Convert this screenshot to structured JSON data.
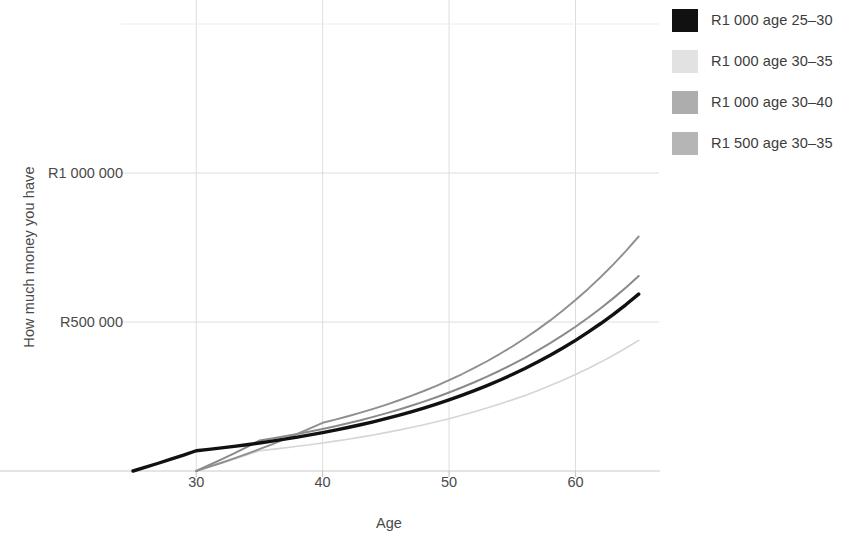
{
  "chart_data": {
    "type": "line",
    "title": "",
    "xlabel": "Age",
    "ylabel": "How much money you have",
    "xlim": [
      25,
      65.5
    ],
    "ylim": [
      0,
      1600000
    ],
    "xticks": [
      30,
      40,
      50,
      60
    ],
    "xtick_labels": [
      "30",
      "40",
      "50",
      "60"
    ],
    "yticks": [
      500000,
      1000000
    ],
    "ytick_labels": [
      "R500 000",
      "R1 000 000"
    ],
    "grid": true,
    "legend_position": "right",
    "series": [
      {
        "name": "R1 000 age 25–30",
        "color": "#111111",
        "width": 3.4,
        "x": [
          25,
          26,
          27,
          28,
          29,
          30,
          31,
          32,
          33,
          34,
          35,
          36,
          37,
          38,
          39,
          40,
          41,
          42,
          43,
          44,
          45,
          46,
          47,
          48,
          49,
          50,
          51,
          52,
          53,
          54,
          55,
          56,
          57,
          58,
          59,
          60,
          61,
          62,
          63,
          64,
          65
        ],
        "y": [
          0,
          12800,
          26000,
          39600,
          53600,
          68000,
          72700,
          77600,
          82800,
          88300,
          94100,
          100200,
          106800,
          113700,
          121000,
          128800,
          137100,
          145900,
          155200,
          165100,
          175600,
          186800,
          198600,
          211200,
          224500,
          238700,
          253700,
          269700,
          286600,
          304600,
          323700,
          344000,
          365500,
          388400,
          412600,
          438400,
          465800,
          494900,
          525800,
          558600,
          593400
        ]
      },
      {
        "name": "R1 000 age 30–35",
        "color": "#d5d5d5",
        "width": 1.6,
        "x": [
          30,
          31,
          32,
          33,
          34,
          35,
          36,
          37,
          38,
          39,
          40,
          41,
          42,
          43,
          44,
          45,
          46,
          47,
          48,
          49,
          50,
          51,
          52,
          53,
          54,
          55,
          56,
          57,
          58,
          59,
          60,
          61,
          62,
          63,
          64,
          65
        ],
        "y": [
          0,
          12800,
          26000,
          39600,
          53600,
          68000,
          72700,
          77600,
          82800,
          88300,
          94100,
          100200,
          106800,
          113700,
          121000,
          128800,
          137100,
          145900,
          155200,
          165100,
          175600,
          186800,
          198600,
          211200,
          224500,
          238700,
          253700,
          269700,
          286600,
          304600,
          323700,
          344000,
          365500,
          388400,
          412600,
          438400
        ]
      },
      {
        "name": "R1 000 age 30–40",
        "color": "#8f8f8f",
        "width": 1.9,
        "x": [
          30,
          31,
          32,
          33,
          34,
          35,
          36,
          37,
          38,
          39,
          40,
          41,
          42,
          43,
          44,
          45,
          46,
          47,
          48,
          49,
          50,
          51,
          52,
          53,
          54,
          55,
          56,
          57,
          58,
          59,
          60,
          61,
          62,
          63,
          64,
          65
        ],
        "y": [
          0,
          13600,
          27700,
          42300,
          57500,
          73200,
          89600,
          106600,
          124300,
          142700,
          161800,
          172400,
          183700,
          195700,
          208500,
          222100,
          236600,
          252000,
          268500,
          286000,
          304700,
          324600,
          345800,
          368400,
          392400,
          418000,
          445300,
          474400,
          505400,
          538400,
          573600,
          611000,
          650900,
          693400,
          738700,
          786900
        ]
      },
      {
        "name": "R1 500 age 30–35",
        "color": "#8a8a8a",
        "width": 2.0,
        "x": [
          30,
          31,
          32,
          33,
          34,
          35,
          36,
          37,
          38,
          39,
          40,
          41,
          42,
          43,
          44,
          45,
          46,
          47,
          48,
          49,
          50,
          51,
          52,
          53,
          54,
          55,
          56,
          57,
          58,
          59,
          60,
          61,
          62,
          63,
          64,
          65
        ],
        "y": [
          0,
          19200,
          39000,
          59400,
          80400,
          102000,
          109000,
          116400,
          124200,
          132400,
          141100,
          150300,
          160100,
          170500,
          181600,
          193300,
          205700,
          218900,
          232900,
          247700,
          263400,
          280100,
          297800,
          316600,
          336500,
          357600,
          380000,
          403800,
          429000,
          455700,
          484100,
          514200,
          546200,
          580100,
          616100,
          654300
        ]
      }
    ]
  },
  "axis": {
    "y_title": "How much money you have",
    "x_title": "Age",
    "y_tick_labels": [
      "R1 000 000",
      "R500 000"
    ],
    "x_tick_labels": [
      "30",
      "40",
      "50",
      "60"
    ]
  },
  "legend": {
    "items": [
      {
        "label": "R1 000 age 25–30",
        "color": "#111111"
      },
      {
        "label": "R1 000 age 30–35",
        "color": "#e2e2e2"
      },
      {
        "label": "R1 000 age 30–40",
        "color": "#adadad"
      },
      {
        "label": "R1 500 age 30–35",
        "color": "#b5b5b5"
      }
    ]
  }
}
